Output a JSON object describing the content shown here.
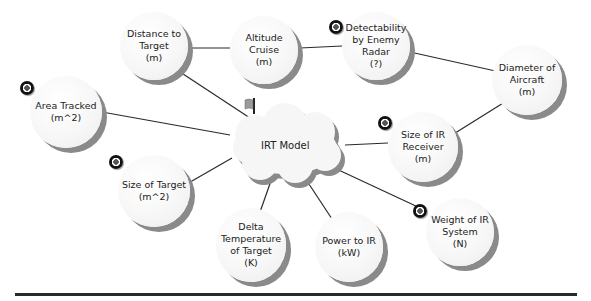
{
  "diagram": {
    "center": {
      "label": "IRT Model",
      "shape": "cloud",
      "has_flag": true
    },
    "nodes": [
      {
        "id": "distance",
        "label": "Distance to\nTarget\n(m)",
        "has_target_icon": false
      },
      {
        "id": "altitude",
        "label": "Altitude Cruise\n(m)",
        "has_target_icon": false
      },
      {
        "id": "detectability",
        "label": "Detectability\nby Enemy\nRadar\n(?)",
        "has_target_icon": true
      },
      {
        "id": "diameter",
        "label": "Diameter of\nAircraft\n(m)",
        "has_target_icon": false
      },
      {
        "id": "area",
        "label": "Area Tracked\n(m^2)",
        "has_target_icon": true
      },
      {
        "id": "ir_receiver",
        "label": "Size of IR\nReceiver\n(m)",
        "has_target_icon": true
      },
      {
        "id": "target_size",
        "label": "Size of Target\n(m^2)",
        "has_target_icon": true
      },
      {
        "id": "delta_temp",
        "label": "Delta\nTemperature\nof Target\n(K)",
        "has_target_icon": false
      },
      {
        "id": "power",
        "label": "Power to IR\n(kW)",
        "has_target_icon": false
      },
      {
        "id": "weight",
        "label": "Weight of IR\nSystem\n(N)",
        "has_target_icon": true
      }
    ],
    "edges": [
      [
        "distance",
        "altitude"
      ],
      [
        "altitude",
        "detectability"
      ],
      [
        "detectability",
        "diameter"
      ],
      [
        "diameter",
        "ir_receiver"
      ],
      [
        "distance",
        "center"
      ],
      [
        "area",
        "center"
      ],
      [
        "ir_receiver",
        "center"
      ],
      [
        "target_size",
        "center"
      ],
      [
        "delta_temp",
        "center"
      ],
      [
        "power",
        "center"
      ],
      [
        "weight",
        "center"
      ]
    ]
  },
  "colors": {
    "line": "#2a2a2a",
    "node_shadow": "#8a8a8a",
    "text": "#222222"
  }
}
